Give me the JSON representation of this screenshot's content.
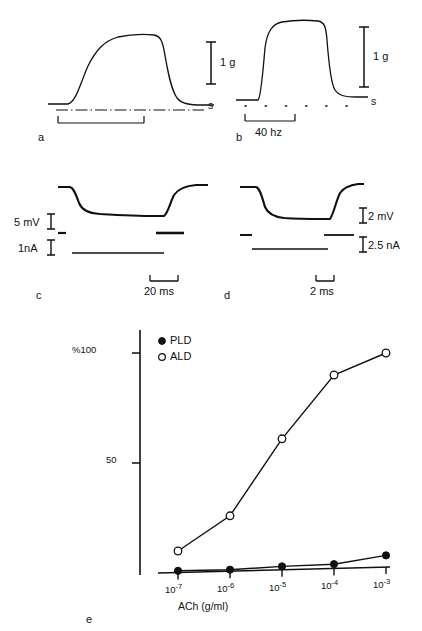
{
  "figure": {
    "background": "#ffffff",
    "ink": "#111111",
    "panels": [
      {
        "letter": "a",
        "type": "contraction-trace",
        "calibration_label": "1 g",
        "stimulus_label": "s",
        "stimulus_style": "dash-dot",
        "description": "slow tonic contraction"
      },
      {
        "letter": "b",
        "type": "contraction-trace",
        "calibration_label": "1 g",
        "stimulus_label": "s",
        "stimulus_style": "dotted",
        "frequency_label": "40 hz",
        "description": "fast twitch tetanic contraction"
      },
      {
        "letter": "c",
        "type": "electrophysiology-trace",
        "voltage_calibration": "5 mV",
        "current_calibration": "1nA",
        "time_calibration": "20 ms"
      },
      {
        "letter": "d",
        "type": "electrophysiology-trace",
        "voltage_calibration": "2 mV",
        "current_calibration": "2.5 nA",
        "time_calibration": "2 ms"
      },
      {
        "letter": "e",
        "type": "dose-response-chart"
      }
    ]
  },
  "chart_data": {
    "type": "line",
    "title": "",
    "xlabel": "ACh (g/ml)",
    "ylabel": "%",
    "x_scale": "log",
    "categories": [
      "10-7",
      "10-6",
      "10-5",
      "10-4",
      "10-3"
    ],
    "x_tick_labels": [
      {
        "mantissa": "10",
        "exponent": "-7"
      },
      {
        "mantissa": "10",
        "exponent": "-6"
      },
      {
        "mantissa": "10",
        "exponent": "-5"
      },
      {
        "mantissa": "10",
        "exponent": "-4"
      },
      {
        "mantissa": "10",
        "exponent": "-3"
      }
    ],
    "y_ticks": [
      50,
      100
    ],
    "y_tick_labels": [
      "50",
      "%100"
    ],
    "ylim": [
      0,
      108
    ],
    "grid": false,
    "legend_position": "top-left-inside",
    "series": [
      {
        "name": "PLD",
        "marker": "filled-circle",
        "values": [
          1,
          1.5,
          3,
          4,
          8
        ]
      },
      {
        "name": "ALD",
        "marker": "open-circle",
        "values": [
          10,
          26,
          61,
          90,
          100
        ]
      }
    ]
  }
}
